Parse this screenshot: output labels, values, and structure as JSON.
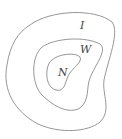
{
  "diagram": {
    "regions": [
      {
        "label": "I",
        "x": 80,
        "y": 19
      },
      {
        "label": "W",
        "x": 80,
        "y": 43
      },
      {
        "label": "N",
        "x": 58,
        "y": 66
      }
    ],
    "stroke_color": "#8a8a8a"
  }
}
